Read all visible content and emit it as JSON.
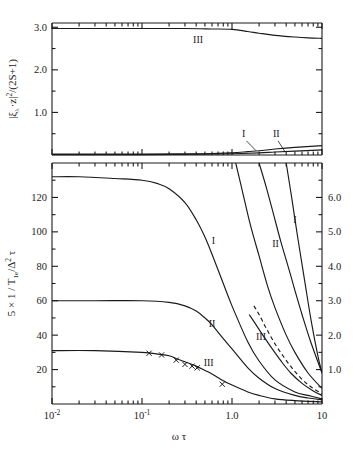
{
  "figure": {
    "name": "two-panel-log-x-plot",
    "background": "#ffffff",
    "line_color": "#1a1a1a"
  },
  "top_panel": {
    "ylabel_parts": {
      "bar1": "|",
      "xi": "ξ",
      "lambda": "λ",
      "dot": "·",
      "z": "z",
      "bar2": "|",
      "sq": "2",
      "slash": "/",
      "paren": "(2S+1)"
    },
    "ylabel_plain": "|ξλ·z|²/(2S+1)",
    "yticks": [
      "3.0",
      "2.0",
      "1.0"
    ],
    "ytick_values": [
      3.0,
      2.0,
      1.0
    ],
    "ylim": [
      0,
      3.1
    ],
    "curve_labels": [
      {
        "text": "III",
        "x": 0.42,
        "y": 2.62
      },
      {
        "text": "I",
        "x": 1.35,
        "y": 0.43
      },
      {
        "text": "II",
        "x": 3.1,
        "y": 0.43
      }
    ]
  },
  "bottom_panel": {
    "ylabel_plain": "5 x 1 / T1e/Δ2 τ",
    "ylabel_parts": {
      "lead": "5 × 1 / T",
      "sub1": "1e",
      "slash": "/",
      "delta": "Δ",
      "sup2": "2",
      "tau": "τ"
    },
    "xlabel_parts": {
      "omega": "ω",
      "tau": "τ"
    },
    "xlabel_plain": "ω τ",
    "xticks": [
      {
        "label_base": "10",
        "label_exp": "-2",
        "value": 0.01
      },
      {
        "label_base": "10",
        "label_exp": "-1",
        "value": 0.1
      },
      {
        "label_base": "1.0",
        "label_exp": "",
        "value": 1.0
      },
      {
        "label_base": "10",
        "label_exp": "",
        "value": 10.0
      }
    ],
    "xlim": [
      0.01,
      10
    ],
    "left_yticks": [
      "120",
      "100",
      "80",
      "60",
      "40",
      "20"
    ],
    "left_ytick_values": [
      120,
      100,
      80,
      60,
      40,
      20
    ],
    "left_ylim": [
      0,
      140
    ],
    "right_yticks": [
      "6.0",
      "5.0",
      "4.0",
      "3.0",
      "2.0",
      "1.0"
    ],
    "right_ytick_values": [
      6.0,
      5.0,
      4.0,
      3.0,
      2.0,
      1.0
    ],
    "right_ylim": [
      0,
      7.0
    ],
    "curve_labels": [
      {
        "text": "I",
        "x": 0.62,
        "y_left": 93
      },
      {
        "text": "II",
        "x": 0.6,
        "y_left": 45
      },
      {
        "text": "III",
        "x": 0.55,
        "y_left": 22
      },
      {
        "text": "II",
        "x": 3.05,
        "y_right": 4.55
      },
      {
        "text": "I",
        "x": 5.0,
        "y_right": 5.25
      },
      {
        "text": "III",
        "x": 2.1,
        "y_right": 1.85
      }
    ]
  },
  "chart_data": {
    "type": "line",
    "title": "",
    "xlabel": "ωτ",
    "xscale": "log",
    "xlim": [
      0.01,
      10
    ],
    "grid": false,
    "legend": "inline curve labels I, II, III",
    "panels": [
      {
        "name": "top",
        "ylabel": "|ξλ·z|²/(2S+1)",
        "ylim": [
          0,
          3.1
        ],
        "yticks": [
          1.0,
          2.0,
          3.0
        ],
        "series": [
          {
            "name": "III",
            "style": "solid",
            "x": [
              0.01,
              0.03,
              0.1,
              0.3,
              0.6,
              1.0,
              1.5,
              2.0,
              3.0,
              5.0,
              7.0,
              10.0
            ],
            "y": [
              2.97,
              2.97,
              2.97,
              2.97,
              2.96,
              2.95,
              2.9,
              2.86,
              2.81,
              2.77,
              2.75,
              2.74
            ]
          },
          {
            "name": "I",
            "style": "solid",
            "x": [
              0.01,
              0.1,
              0.5,
              1.0,
              1.5,
              2.0,
              3.0,
              5.0,
              10.0
            ],
            "y": [
              0.02,
              0.02,
              0.03,
              0.05,
              0.08,
              0.1,
              0.14,
              0.18,
              0.22
            ]
          },
          {
            "name": "II",
            "style": "solid",
            "x": [
              0.01,
              0.1,
              0.5,
              1.0,
              2.0,
              3.0,
              5.0,
              10.0
            ],
            "y": [
              0.01,
              0.01,
              0.02,
              0.03,
              0.05,
              0.07,
              0.09,
              0.12
            ]
          }
        ]
      },
      {
        "name": "bottom-left-axis",
        "ylabel": "5 × 1/T1e/Δ²τ",
        "ylim": [
          0,
          140
        ],
        "yticks": [
          20,
          40,
          60,
          80,
          100,
          120
        ],
        "series": [
          {
            "name": "I",
            "style": "solid",
            "x": [
              0.01,
              0.02,
              0.05,
              0.1,
              0.15,
              0.2,
              0.3,
              0.4,
              0.5,
              0.6,
              0.8,
              1.0,
              1.5,
              2.0,
              3.0,
              5.0,
              7.0,
              10.0
            ],
            "y": [
              132,
              132,
              131,
              130,
              128,
              125,
              117,
              107,
              97,
              87,
              70,
              57,
              36,
              25,
              14,
              7,
              5,
              3
            ]
          },
          {
            "name": "II",
            "style": "solid",
            "x": [
              0.01,
              0.03,
              0.1,
              0.2,
              0.3,
              0.4,
              0.5,
              0.6,
              0.8,
              1.0,
              1.5,
              2.0,
              3.0,
              5.0,
              7.0,
              10.0
            ],
            "y": [
              60,
              60,
              60,
              59,
              57,
              54,
              50,
              46,
              38,
              32,
              21,
              15,
              9,
              5,
              3.5,
              2.5
            ]
          },
          {
            "name": "III",
            "style": "solid",
            "markers": "x",
            "x": [
              0.01,
              0.03,
              0.1,
              0.15,
              0.2,
              0.25,
              0.3,
              0.4,
              0.5,
              0.6,
              0.8,
              1.0,
              1.5,
              2.0,
              3.0,
              5.0,
              10.0
            ],
            "y": [
              31,
              31,
              30,
              29,
              28,
              26,
              24.5,
              22,
              19.5,
              17.5,
              13.5,
              11,
              7,
              5,
              3,
              2,
              1.2
            ],
            "marker_x": [
              0.12,
              0.165,
              0.24,
              0.3,
              0.36,
              0.41,
              0.78
            ],
            "marker_y": [
              29.5,
              28.5,
              25.5,
              23.0,
              22.0,
              21.0,
              11.5
            ]
          }
        ]
      },
      {
        "name": "bottom-right-axis",
        "ylabel": "right scale",
        "ylim": [
          0,
          7.0
        ],
        "yticks": [
          1.0,
          2.0,
          3.0,
          4.0,
          5.0,
          6.0
        ],
        "series": [
          {
            "name": "II",
            "style": "solid",
            "x": [
              1.1,
              1.3,
              1.6,
              2.0,
              2.5,
              3.0,
              4.0,
              5.0,
              7.0,
              10.0
            ],
            "y": [
              7.0,
              6.2,
              5.2,
              4.3,
              3.4,
              2.8,
              2.0,
              1.5,
              0.9,
              0.45
            ]
          },
          {
            "name": "I",
            "style": "solid",
            "x": [
              2.0,
              2.4,
              2.9,
              3.5,
              4.2,
              5.0,
              6.0,
              7.5,
              10.0
            ],
            "y": [
              7.0,
              6.3,
              5.5,
              4.7,
              4.0,
              3.3,
              2.6,
              1.8,
              0.9
            ]
          },
          {
            "name": "III",
            "style": "solid",
            "x": [
              1.55,
              1.8,
              2.2,
              2.8,
              3.5,
              4.5,
              6.0,
              8.0,
              10.0
            ],
            "y": [
              2.6,
              2.35,
              2.0,
              1.6,
              1.25,
              0.9,
              0.6,
              0.38,
              0.25
            ]
          },
          {
            "name": "III-dashed",
            "style": "dashed",
            "x": [
              1.75,
              2.0,
              2.4,
              3.0,
              3.8,
              4.8,
              6.2,
              8.0,
              10.0
            ],
            "y": [
              2.85,
              2.6,
              2.2,
              1.75,
              1.35,
              1.0,
              0.68,
              0.45,
              0.3
            ]
          },
          {
            "name": "extra-right",
            "style": "solid",
            "x": [
              4.0,
              4.6,
              5.4,
              6.4,
              7.6,
              9.0,
              10.0
            ],
            "y": [
              7.0,
              6.0,
              4.8,
              3.6,
              2.4,
              1.4,
              0.9
            ]
          }
        ]
      }
    ]
  }
}
